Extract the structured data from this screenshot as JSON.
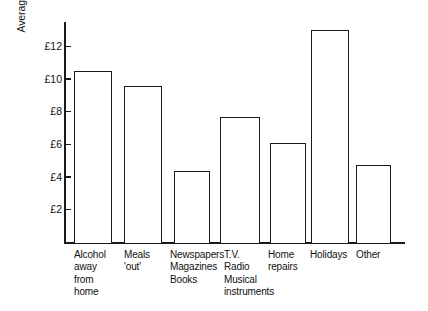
{
  "chart_data": {
    "type": "bar",
    "title": "",
    "xlabel": "",
    "ylabel": "Average weekly expenditure",
    "categories": [
      "Alcohol\naway\nfrom\nhome",
      "Meals\n'out'",
      "Newspapers\nMagazines\nBooks",
      "T.V.\nRadio\nMusical\ninstruments",
      "Home\nrepairs",
      "Holidays",
      "Other"
    ],
    "values": [
      10.5,
      9.55,
      4.35,
      7.65,
      6.1,
      13.0,
      4.75
    ],
    "tick_labels": [
      "£2",
      "£4",
      "£6",
      "£8",
      "£10",
      "£12"
    ],
    "tick_values": [
      2,
      4,
      6,
      8,
      10,
      12
    ],
    "ylim": [
      0,
      13.6
    ],
    "currency_symbol": "£",
    "grid": false,
    "legend": null,
    "bar_fill": "#ffffff",
    "bar_stroke": "#1a1a1a",
    "axis_color": "#1a1a1a",
    "background": "#ffffff"
  }
}
